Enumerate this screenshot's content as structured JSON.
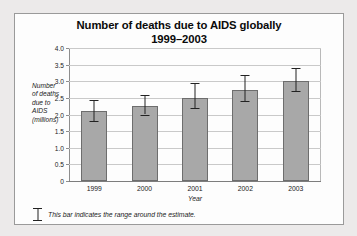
{
  "chart_data": {
    "type": "bar",
    "title": "Number of deaths due to AIDS globally 1999–2003",
    "title_line1": "Number of deaths due to AIDS globally",
    "title_line2": "1999–2003",
    "xlabel": "Year",
    "ylabel": "Number of deaths due to AIDS (millions)",
    "ylabel_lines": [
      "Number",
      "of deaths",
      "due to",
      "AIDS",
      "(millions)"
    ],
    "categories": [
      "1999",
      "2000",
      "2001",
      "2002",
      "2003"
    ],
    "values": [
      2.1,
      2.25,
      2.5,
      2.75,
      3.0
    ],
    "error_low": [
      1.8,
      2.0,
      2.2,
      2.4,
      2.7
    ],
    "error_high": [
      2.45,
      2.6,
      2.95,
      3.2,
      3.4
    ],
    "ylim": [
      0,
      4.0
    ],
    "ytick_values": [
      4.0,
      3.5,
      3.0,
      2.5,
      2.0,
      1.5,
      1.0,
      0.5,
      0
    ],
    "ytick_labels": [
      "4.0",
      "3.5",
      "3.0",
      "2.5",
      "2.0",
      "1.5",
      "1.0",
      "0.5",
      "0"
    ],
    "grid": true,
    "legend": false,
    "bar_color": "#a8a8a8",
    "bar_edge_color": "#6d6d6d",
    "error_color": "#222222",
    "grid_color": "#c9c9c9",
    "background": "#fdfdfd"
  },
  "footnote": {
    "icon": "error-bar-icon",
    "text": "This bar indicates the range around the estimate."
  }
}
